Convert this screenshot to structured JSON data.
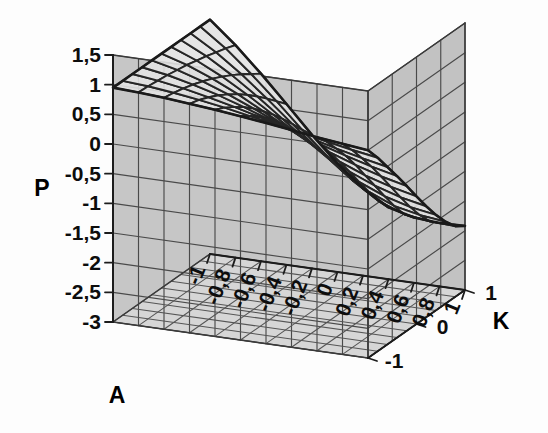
{
  "figure": {
    "kind": "3d-surface-plot",
    "background_color": "#fdfdfd",
    "wall_back_color": "#c6c6c6",
    "wall_right_color": "#c2c2c2",
    "floor_color": "#d6d6d6",
    "grid_color": "#4a4a4a",
    "surface_fill": "#e2e2e2",
    "surface_line_color": "#1a1a1a",
    "axis_color": "#1c1c1c"
  },
  "axes": {
    "z": {
      "title": "P",
      "title_x": 42,
      "title_y": 196,
      "min": -3,
      "max": 1.5,
      "step": 0.5,
      "ticks": [
        "1,5",
        "1",
        "0,5",
        "0",
        "-0,5",
        "-1",
        "-1,5",
        "-2",
        "-2,5",
        "-3"
      ],
      "tick_values": [
        1.5,
        1,
        0.5,
        0,
        -0.5,
        -1,
        -1.5,
        -2,
        -2.5,
        -3
      ]
    },
    "x": {
      "title": "A",
      "title_x": 117,
      "title_y": 403,
      "min": -1,
      "max": 1,
      "step": 0.2,
      "ticks": [
        "-1",
        "-0,8",
        "-0,6",
        "-0,4",
        "-0,2",
        "0",
        "0,2",
        "0,4",
        "0,6",
        "0,8",
        "1"
      ],
      "tick_values": [
        -1,
        -0.8,
        -0.6,
        -0.4,
        -0.2,
        0,
        0.2,
        0.4,
        0.6,
        0.8,
        1
      ],
      "label_rotation": -68
    },
    "y": {
      "title": "K",
      "title_x": 501,
      "title_y": 329,
      "min": -1,
      "max": 1,
      "step": 1,
      "ticks": [
        "-1",
        "0",
        "1"
      ],
      "tick_values": [
        -1,
        0,
        1
      ]
    }
  },
  "chart_data": {
    "type": "surface",
    "title": "",
    "xlabel": "A",
    "ylabel": "K",
    "zlabel": "P",
    "xlim": [
      -1,
      1
    ],
    "ylim": [
      -1,
      1
    ],
    "zlim": [
      -3,
      1.5
    ],
    "grid": true,
    "legend": "none",
    "x": [
      -1,
      -0.8,
      -0.6,
      -0.4,
      -0.2,
      0,
      0.2,
      0.4,
      0.6,
      0.8,
      1
    ],
    "y": [
      -1,
      -0.8,
      -0.6,
      -0.4,
      -0.2,
      0,
      0.2,
      0.4,
      0.6,
      0.8,
      1
    ],
    "z_note": "P(A,K) surface; converges to ~1 at A=-1 for all K, fans out and drops toward P=-1.9 near A=1, K=1",
    "z": [
      [
        0.95,
        0.95,
        0.95,
        0.95,
        0.95,
        0.95,
        0.95,
        0.95,
        0.95,
        0.95,
        0.95
      ],
      [
        0.93,
        0.92,
        0.9,
        0.88,
        0.85,
        0.82,
        0.78,
        0.74,
        0.69,
        0.64,
        0.58
      ],
      [
        0.9,
        0.87,
        0.83,
        0.78,
        0.72,
        0.65,
        0.57,
        0.48,
        0.38,
        0.27,
        0.16
      ],
      [
        0.86,
        0.81,
        0.74,
        0.66,
        0.56,
        0.45,
        0.32,
        0.18,
        0.03,
        -0.13,
        -0.29
      ],
      [
        0.82,
        0.74,
        0.64,
        0.52,
        0.38,
        0.22,
        0.05,
        -0.14,
        -0.34,
        -0.55,
        -0.75
      ],
      [
        0.77,
        0.66,
        0.53,
        0.37,
        0.19,
        -0.01,
        -0.23,
        -0.46,
        -0.7,
        -0.94,
        -1.17
      ],
      [
        0.72,
        0.58,
        0.41,
        0.22,
        0.0,
        -0.24,
        -0.49,
        -0.76,
        -1.03,
        -1.29,
        -1.53
      ],
      [
        0.66,
        0.49,
        0.29,
        0.07,
        -0.18,
        -0.45,
        -0.73,
        -1.02,
        -1.3,
        -1.57,
        -1.79
      ],
      [
        0.6,
        0.41,
        0.18,
        -0.06,
        -0.33,
        -0.62,
        -0.91,
        -1.2,
        -1.48,
        -1.73,
        -1.9
      ],
      [
        0.55,
        0.33,
        0.08,
        -0.18,
        -0.46,
        -0.75,
        -1.04,
        -1.32,
        -1.57,
        -1.79,
        -1.93
      ],
      [
        0.5,
        0.26,
        -0.01,
        -0.28,
        -0.56,
        -0.85,
        -1.13,
        -1.39,
        -1.62,
        -1.81,
        -1.92
      ]
    ]
  },
  "projection": {
    "origin_x": 113,
    "origin_y": 322,
    "x_axis_vec": [
      255,
      36
    ],
    "y_axis_vec": [
      97,
      -68
    ],
    "z_axis_px_per_unit": 59.4,
    "z_top_y": 55
  }
}
